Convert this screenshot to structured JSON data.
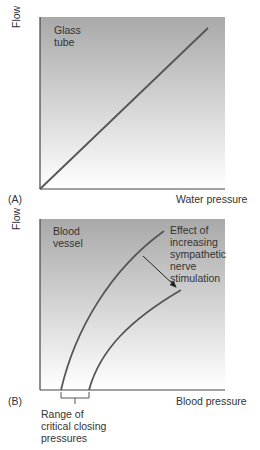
{
  "panels": [
    {
      "id": "A",
      "panel_label": "(A)",
      "ylabel": "Flow",
      "xlabel": "Water pressure",
      "inset_label_line1": "Glass",
      "inset_label_line2": "tube",
      "relationship": "linear"
    },
    {
      "id": "B",
      "panel_label": "(B)",
      "ylabel": "Flow",
      "xlabel": "Blood pressure",
      "inset_label_line1": "Blood",
      "inset_label_line2": "vessel",
      "annotation": [
        "Effect of",
        "increasing",
        "sympathetic",
        "nerve",
        "stimulation"
      ],
      "bracket_label": [
        "Range of",
        "critical closing",
        "pressures"
      ],
      "relationship": "curved, shifted right with sympathetic stimulation"
    }
  ],
  "colors": {
    "curve": "#555555",
    "axis": "#444444",
    "bg_top": "#a9a9a9",
    "bg_bottom": "#ffffff"
  }
}
